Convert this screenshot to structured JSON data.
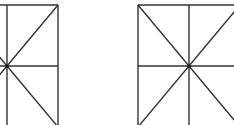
{
  "diagram": {
    "stroke_color": "#333333",
    "background_color": "#ffffff",
    "figures": [
      {
        "id": "left-figure",
        "center": [
          7,
          66
        ],
        "lines": [
          {
            "x1": -44,
            "y1": 5,
            "x2": 58,
            "y2": 5
          },
          {
            "x1": 7,
            "y1": 5,
            "x2": 7,
            "y2": 125
          },
          {
            "x1": 58,
            "y1": 5,
            "x2": 58,
            "y2": 125
          },
          {
            "x1": -44,
            "y1": 66,
            "x2": 58,
            "y2": 66
          },
          {
            "x1": 7,
            "y1": 66,
            "x2": 58,
            "y2": 5
          },
          {
            "x1": 7,
            "y1": 66,
            "x2": 58,
            "y2": 127
          },
          {
            "x1": 7,
            "y1": 66,
            "x2": -44,
            "y2": 5
          },
          {
            "x1": 7,
            "y1": 66,
            "x2": -44,
            "y2": 127
          }
        ]
      },
      {
        "id": "right-figure",
        "center": [
          189,
          66
        ],
        "lines": [
          {
            "x1": 138,
            "y1": 5,
            "x2": 240,
            "y2": 5
          },
          {
            "x1": 138,
            "y1": 5,
            "x2": 138,
            "y2": 125
          },
          {
            "x1": 189,
            "y1": 5,
            "x2": 189,
            "y2": 125
          },
          {
            "x1": 138,
            "y1": 66,
            "x2": 240,
            "y2": 66
          },
          {
            "x1": 138,
            "y1": 5,
            "x2": 240,
            "y2": 127
          },
          {
            "x1": 138,
            "y1": 127,
            "x2": 240,
            "y2": 5
          }
        ]
      }
    ]
  }
}
